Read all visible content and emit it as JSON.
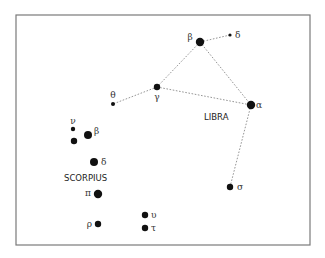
{
  "diagram": {
    "title": "",
    "frame": {
      "x": 16,
      "y": 15,
      "width": 294,
      "height": 230,
      "stroke": "#7a7a7a"
    },
    "line_color": "#8a8a8a",
    "star_color": "#111111",
    "constellations": [
      {
        "name": "LIBRA",
        "label_x": 204,
        "label_y": 120
      },
      {
        "name": "SCORPIUS",
        "label_x": 64,
        "label_y": 181
      }
    ],
    "stars": [
      {
        "id": "lib-beta",
        "greek": "β",
        "x": 200,
        "y": 42,
        "r": 4.2,
        "lx": 190,
        "ly": 40,
        "anchor": "middle"
      },
      {
        "id": "lib-delta",
        "greek": "δ",
        "x": 230,
        "y": 35,
        "r": 1.6,
        "lx": 235,
        "ly": 38,
        "anchor": "start"
      },
      {
        "id": "lib-gamma",
        "greek": "γ",
        "x": 157,
        "y": 87,
        "r": 3.2,
        "lx": 157,
        "ly": 100,
        "anchor": "middle"
      },
      {
        "id": "lib-theta",
        "greek": "θ",
        "x": 113,
        "y": 104,
        "r": 2.0,
        "lx": 113,
        "ly": 98,
        "anchor": "middle"
      },
      {
        "id": "lib-alpha",
        "greek": "α",
        "x": 251,
        "y": 105,
        "r": 4.2,
        "lx": 256,
        "ly": 108,
        "anchor": "start"
      },
      {
        "id": "lib-sigma",
        "greek": "σ",
        "x": 230,
        "y": 187,
        "r": 3.2,
        "lx": 237,
        "ly": 190,
        "anchor": "start"
      },
      {
        "id": "sco-nu",
        "greek": "ν",
        "x": 73,
        "y": 129,
        "r": 2.2,
        "lx": 73,
        "ly": 124,
        "anchor": "middle"
      },
      {
        "id": "sco-beta1",
        "greek": "β",
        "x": 88,
        "y": 135,
        "r": 4.0,
        "lx": 94,
        "ly": 134,
        "anchor": "start"
      },
      {
        "id": "sco-beta2",
        "greek": "",
        "x": 74,
        "y": 141,
        "r": 3.2,
        "lx": 0,
        "ly": 0,
        "anchor": "start"
      },
      {
        "id": "sco-delta",
        "greek": "δ",
        "x": 94,
        "y": 162,
        "r": 4.0,
        "lx": 101,
        "ly": 165,
        "anchor": "start"
      },
      {
        "id": "sco-pi",
        "greek": "π",
        "x": 98,
        "y": 194,
        "r": 4.2,
        "lx": 91,
        "ly": 196,
        "anchor": "end"
      },
      {
        "id": "sco-rho",
        "greek": "ρ",
        "x": 98,
        "y": 224,
        "r": 3.2,
        "lx": 92,
        "ly": 227,
        "anchor": "end"
      },
      {
        "id": "sco-upsilon",
        "greek": "υ",
        "x": 145,
        "y": 215,
        "r": 3.2,
        "lx": 151,
        "ly": 218,
        "anchor": "start"
      },
      {
        "id": "sco-tau",
        "greek": "τ",
        "x": 145,
        "y": 228,
        "r": 3.2,
        "lx": 151,
        "ly": 231,
        "anchor": "start"
      }
    ],
    "lines": [
      {
        "from": "lib-delta",
        "to": "lib-beta"
      },
      {
        "from": "lib-beta",
        "to": "lib-gamma"
      },
      {
        "from": "lib-gamma",
        "to": "lib-theta"
      },
      {
        "from": "lib-gamma",
        "to": "lib-alpha"
      },
      {
        "from": "lib-beta",
        "to": "lib-alpha"
      },
      {
        "from": "lib-alpha",
        "to": "lib-sigma"
      }
    ]
  }
}
